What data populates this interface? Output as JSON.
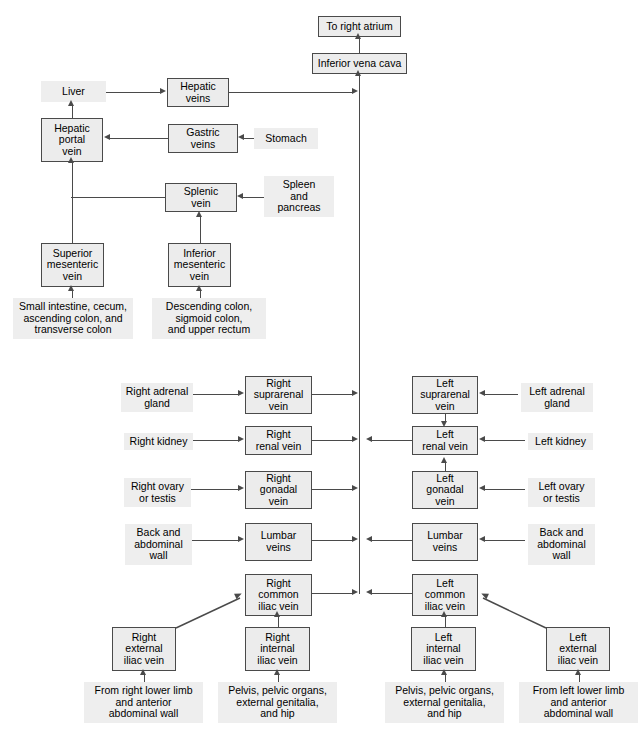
{
  "diagram": {
    "colors": {
      "box_fill": "#ececec",
      "box_border": "#4a4a4a",
      "label_fill": "#eeeeee",
      "line": "#4a4a4a",
      "text": "#000000",
      "page_background": "#ffffff"
    }
  },
  "nodes": {
    "to_right_atrium": "To right atrium",
    "inferior_vena_cava": "Inferior vena cava",
    "liver": "Liver",
    "hepatic_veins": "Hepatic\nveins",
    "hepatic_portal_vein": "Hepatic\nportal\nvein",
    "gastric_veins": "Gastric\nveins",
    "stomach": "Stomach",
    "splenic_vein": "Splenic\nvein",
    "spleen_and_pancreas": "Spleen\nand\npancreas",
    "superior_mesenteric_vein": "Superior\nmesenteric\nvein",
    "inferior_mesenteric_vein": "Inferior\nmesenteric\nvein",
    "small_intestine_group": "Small intestine, cecum,\nascending colon, and\ntransverse colon",
    "descending_colon_group": "Descending colon,\nsigmoid colon,\nand upper rectum",
    "right_adrenal_gland": "Right adrenal\ngland",
    "right_suprarenal_vein": "Right\nsuprarenal\nvein",
    "left_suprarenal_vein": "Left\nsuprarenal\nvein",
    "left_adrenal_gland": "Left adrenal\ngland",
    "right_kidney": "Right kidney",
    "right_renal_vein": "Right\nrenal vein",
    "left_renal_vein": "Left\nrenal vein",
    "left_kidney": "Left kidney",
    "right_ovary_or_testis": "Right ovary\nor testis",
    "right_gonadal_vein": "Right\ngonadal\nvein",
    "left_gonadal_vein": "Left\ngonadal\nvein",
    "left_ovary_or_testis": "Left ovary\nor testis",
    "right_back_abdominal_wall": "Back and\nabdominal\nwall",
    "right_lumbar_veins": "Lumbar\nveins",
    "left_lumbar_veins": "Lumbar\nveins",
    "left_back_abdominal_wall": "Back and\nabdominal\nwall",
    "right_common_iliac_vein": "Right\ncommon\niliac vein",
    "left_common_iliac_vein": "Left\ncommon\niliac vein",
    "right_external_iliac_vein": "Right\nexternal\niliac vein",
    "right_internal_iliac_vein": "Right\ninternal\niliac vein",
    "left_internal_iliac_vein": "Left\ninternal\niliac vein",
    "left_external_iliac_vein": "Left\nexternal\niliac vein",
    "from_right_lower_limb": "From right lower limb\nand anterior\nabdominal wall",
    "right_pelvis_group": "Pelvis, pelvic organs,\nexternal genitalia,\nand hip",
    "left_pelvis_group": "Pelvis, pelvic organs,\nexternal genitalia,\nand hip",
    "from_left_lower_limb": "From left lower limb\nand anterior\nabdominal wall"
  }
}
